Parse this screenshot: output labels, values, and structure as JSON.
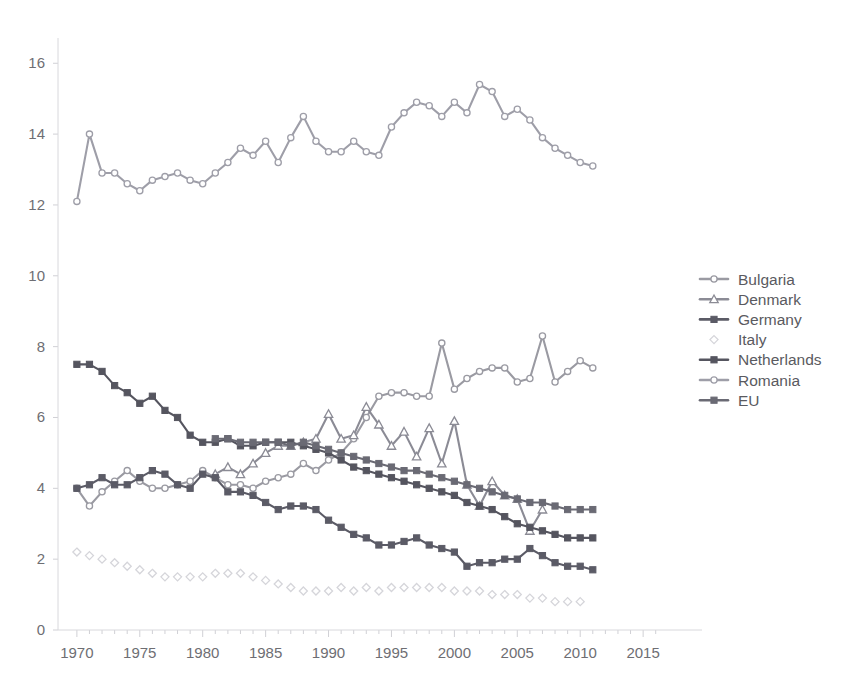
{
  "chart_data": {
    "type": "line",
    "title": "",
    "xlabel": "",
    "ylabel": "",
    "xlim": [
      1968.5,
      2016.5
    ],
    "ylim": [
      0,
      16.6
    ],
    "xticks": [
      1970,
      1975,
      1980,
      1985,
      1990,
      1995,
      2000,
      2005,
      2010,
      2015
    ],
    "yticks": [
      0,
      2,
      4,
      6,
      8,
      10,
      12,
      14,
      16
    ],
    "grid": false,
    "legend_position": "right",
    "series": [
      {
        "name": "Bulgaria",
        "color": "#9a9aa2",
        "marker": "circle",
        "marker_filled": false,
        "x": [
          1970,
          1971,
          1972,
          1973,
          1974,
          1975,
          1976,
          1977,
          1978,
          1979,
          1980,
          1981,
          1982,
          1983,
          1984,
          1985,
          1986,
          1987,
          1988,
          1989,
          1990,
          1991,
          1992,
          1993,
          1994,
          1995,
          1996,
          1997,
          1998,
          1999,
          2000,
          2001,
          2002,
          2003,
          2004,
          2005,
          2006,
          2007,
          2008,
          2009,
          2010,
          2011
        ],
        "values": [
          4.0,
          3.5,
          3.9,
          4.2,
          4.5,
          4.2,
          4.0,
          4.0,
          4.1,
          4.2,
          4.5,
          4.3,
          4.1,
          4.1,
          4.0,
          4.2,
          4.3,
          4.4,
          4.7,
          4.5,
          4.8,
          5.0,
          5.4,
          6.0,
          6.6,
          6.7,
          6.7,
          6.6,
          6.6,
          8.1,
          6.8,
          7.1,
          7.3,
          7.4,
          7.4,
          7.0,
          7.1,
          8.3,
          7.0,
          7.3,
          7.6,
          7.4
        ]
      },
      {
        "name": "Denmark",
        "color": "#8b8b95",
        "marker": "triangle",
        "marker_filled": false,
        "x": [
          1981,
          1982,
          1983,
          1984,
          1985,
          1986,
          1987,
          1988,
          1989,
          1990,
          1991,
          1992,
          1993,
          1994,
          1995,
          1996,
          1997,
          1998,
          1999,
          2000,
          2001,
          2002,
          2003,
          2004,
          2005,
          2006,
          2007
        ],
        "values": [
          4.4,
          4.6,
          4.4,
          4.7,
          5.0,
          5.2,
          5.2,
          5.3,
          5.4,
          6.1,
          5.4,
          5.5,
          6.3,
          5.8,
          5.2,
          5.6,
          4.9,
          5.7,
          4.7,
          5.9,
          4.1,
          3.5,
          4.2,
          3.8,
          3.7,
          2.8,
          3.4
        ]
      },
      {
        "name": "Germany",
        "color": "#5b5b66",
        "marker": "square",
        "marker_filled": true,
        "x": [
          1970,
          1971,
          1972,
          1973,
          1974,
          1975,
          1976,
          1977,
          1978,
          1979,
          1980,
          1981,
          1982,
          1983,
          1984,
          1985,
          1986,
          1987,
          1988,
          1989,
          1990,
          1991,
          1992,
          1993,
          1994,
          1995,
          1996,
          1997,
          1998,
          1999,
          2000,
          2001,
          2002,
          2003,
          2004,
          2005,
          2006,
          2007,
          2008,
          2009,
          2010,
          2011
        ],
        "values": [
          4.0,
          4.1,
          4.3,
          4.1,
          4.1,
          4.3,
          4.5,
          4.4,
          4.1,
          4.0,
          4.4,
          4.3,
          3.9,
          3.9,
          3.8,
          3.6,
          3.4,
          3.5,
          3.5,
          3.4,
          3.1,
          2.9,
          2.7,
          2.6,
          2.4,
          2.4,
          2.5,
          2.6,
          2.4,
          2.3,
          2.2,
          1.8,
          1.9,
          1.9,
          2.0,
          2.0,
          2.3,
          2.1,
          1.9,
          1.8,
          1.8,
          1.7
        ]
      },
      {
        "name": "Italy",
        "color": "#d5d5da",
        "marker": "diamond",
        "marker_filled": false,
        "connect": false,
        "x": [
          1970,
          1971,
          1972,
          1973,
          1974,
          1975,
          1976,
          1977,
          1978,
          1979,
          1980,
          1981,
          1982,
          1983,
          1984,
          1985,
          1986,
          1987,
          1988,
          1989,
          1990,
          1991,
          1992,
          1993,
          1994,
          1995,
          1996,
          1997,
          1998,
          1999,
          2000,
          2001,
          2002,
          2003,
          2004,
          2005,
          2006,
          2007,
          2008,
          2009,
          2010
        ],
        "values": [
          2.2,
          2.1,
          2.0,
          1.9,
          1.8,
          1.7,
          1.6,
          1.5,
          1.5,
          1.5,
          1.5,
          1.6,
          1.6,
          1.6,
          1.5,
          1.4,
          1.3,
          1.2,
          1.1,
          1.1,
          1.1,
          1.2,
          1.1,
          1.2,
          1.1,
          1.2,
          1.2,
          1.2,
          1.2,
          1.2,
          1.1,
          1.1,
          1.1,
          1.0,
          1.0,
          1.0,
          0.9,
          0.9,
          0.8,
          0.8,
          0.8
        ]
      },
      {
        "name": "Netherlands",
        "color": "#55555f",
        "marker": "square",
        "marker_filled": true,
        "x": [
          1970,
          1971,
          1972,
          1973,
          1974,
          1975,
          1976,
          1977,
          1978,
          1979,
          1980,
          1981,
          1982,
          1983,
          1984,
          1985,
          1986,
          1987,
          1988,
          1989,
          1990,
          1991,
          1992,
          1993,
          1994,
          1995,
          1996,
          1997,
          1998,
          1999,
          2000,
          2001,
          2002,
          2003,
          2004,
          2005,
          2006,
          2007,
          2008,
          2009,
          2010,
          2011
        ],
        "values": [
          7.5,
          7.5,
          7.3,
          6.9,
          6.7,
          6.4,
          6.6,
          6.2,
          6.0,
          5.5,
          5.3,
          5.3,
          5.4,
          5.2,
          5.2,
          5.3,
          5.3,
          5.3,
          5.2,
          5.1,
          5.0,
          4.8,
          4.6,
          4.5,
          4.4,
          4.3,
          4.2,
          4.1,
          4.0,
          3.9,
          3.8,
          3.6,
          3.5,
          3.4,
          3.2,
          3.0,
          2.9,
          2.8,
          2.7,
          2.6,
          2.6,
          2.6
        ]
      },
      {
        "name": "Romania",
        "color": "#9e9ea8",
        "marker": "circle",
        "marker_filled": false,
        "x": [
          1970,
          1971,
          1972,
          1973,
          1974,
          1975,
          1976,
          1977,
          1978,
          1979,
          1980,
          1981,
          1982,
          1983,
          1984,
          1985,
          1986,
          1987,
          1988,
          1989,
          1990,
          1991,
          1992,
          1993,
          1994,
          1995,
          1996,
          1997,
          1998,
          1999,
          2000,
          2001,
          2002,
          2003,
          2004,
          2005,
          2006,
          2007,
          2008,
          2009,
          2010,
          2011
        ],
        "values": [
          12.1,
          14.0,
          12.9,
          12.9,
          12.6,
          12.4,
          12.7,
          12.8,
          12.9,
          12.7,
          12.6,
          12.9,
          13.2,
          13.6,
          13.4,
          13.8,
          13.2,
          13.9,
          14.5,
          13.8,
          13.5,
          13.5,
          13.8,
          13.5,
          13.4,
          14.2,
          14.6,
          14.9,
          14.8,
          14.5,
          14.9,
          14.6,
          15.4,
          15.2,
          14.5,
          14.7,
          14.4,
          13.9,
          13.6,
          13.4,
          13.2,
          13.1
        ]
      },
      {
        "name": "EU",
        "color": "#6a6a74",
        "marker": "square",
        "marker_filled": true,
        "x": [
          1981,
          1982,
          1983,
          1984,
          1985,
          1986,
          1987,
          1988,
          1989,
          1990,
          1991,
          1992,
          1993,
          1994,
          1995,
          1996,
          1997,
          1998,
          1999,
          2000,
          2001,
          2002,
          2003,
          2004,
          2005,
          2006,
          2007,
          2008,
          2009,
          2010,
          2011
        ],
        "values": [
          5.4,
          5.4,
          5.3,
          5.3,
          5.3,
          5.3,
          5.2,
          5.3,
          5.2,
          5.1,
          5.0,
          4.9,
          4.8,
          4.7,
          4.6,
          4.5,
          4.5,
          4.4,
          4.3,
          4.2,
          4.1,
          4.0,
          3.9,
          3.8,
          3.7,
          3.6,
          3.6,
          3.5,
          3.4,
          3.4,
          3.4
        ]
      }
    ]
  },
  "legend": {
    "items": [
      {
        "label": "Bulgaria"
      },
      {
        "label": "Denmark"
      },
      {
        "label": "Germany"
      },
      {
        "label": "Italy"
      },
      {
        "label": "Netherlands"
      },
      {
        "label": "Romania"
      },
      {
        "label": "EU"
      }
    ]
  },
  "axes": {
    "y_tick_labels": [
      "16",
      "14",
      "12",
      "10",
      "8",
      "6",
      "4",
      "2",
      "0"
    ],
    "x_tick_labels": [
      "1970",
      "1975",
      "1980",
      "1985",
      "1990",
      "1995",
      "2000",
      "2005",
      "2010",
      "2015"
    ]
  }
}
